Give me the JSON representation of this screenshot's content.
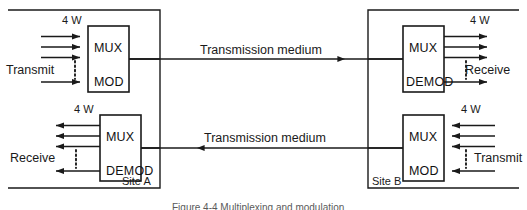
{
  "figure": {
    "caption": "Figure 4-4  Multiplexing and modulation"
  },
  "sites": {
    "a": {
      "label": "Site A"
    },
    "b": {
      "label": "Site B"
    }
  },
  "links": [
    {
      "label": "Transmission medium",
      "direction": "left-to-right"
    },
    {
      "label": "Transmission medium",
      "direction": "right-to-left"
    }
  ],
  "units": {
    "wires": "4 W"
  },
  "blocks": [
    {
      "id": "site-a-transmit",
      "upper_label": "MUX",
      "lower_label": "MOD",
      "port_label": "Transmit",
      "wire_label": "4 W",
      "arrow_direction": "into-block-from-left",
      "channel_count": 4
    },
    {
      "id": "site-a-receive",
      "upper_label": "MUX",
      "lower_label": "DEMOD",
      "port_label": "Receive",
      "wire_label": "4 W",
      "arrow_direction": "out-of-block-to-left",
      "channel_count": 4
    },
    {
      "id": "site-b-receive",
      "upper_label": "MUX",
      "lower_label": "DEMOD",
      "port_label": "Receive",
      "wire_label": "4 W",
      "arrow_direction": "out-of-block-to-right",
      "channel_count": 4
    },
    {
      "id": "site-b-transmit",
      "upper_label": "MUX",
      "lower_label": "MOD",
      "port_label": "Transmit",
      "wire_label": "4 W",
      "arrow_direction": "into-block-from-right",
      "channel_count": 4
    }
  ],
  "colors": {
    "stroke": "#1a1a1a",
    "text": "#111111",
    "background": "#ffffff"
  }
}
